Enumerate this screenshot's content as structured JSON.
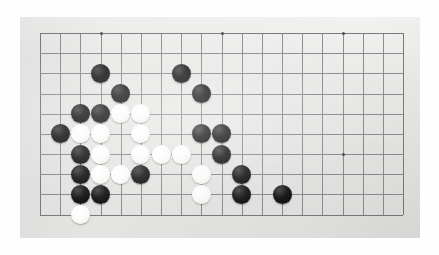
{
  "scene": {
    "kind": "go-board-photograph",
    "description": "Photograph of a Go (Weiqi / Baduk) board, cropped to the lower-left portion of the board"
  },
  "colors": {
    "page_background": "#fefefe",
    "board_surface": "#e8e8e6",
    "grid_line": "#8d8d8d",
    "board_edge_line": "#7a7a7a",
    "star_point": "#4e4e4e",
    "black_stone": "#141414",
    "white_stone": "#fbfbfa"
  },
  "board": {
    "surface_rect": {
      "x": 20,
      "y": 17,
      "width": 400,
      "height": 221
    },
    "origin": {
      "x": 40,
      "y": 33
    },
    "pitch": 20.17,
    "columns": 19,
    "rows": 10,
    "stone_diameter": 19,
    "star_points": [
      {
        "col": 3,
        "row": 0
      },
      {
        "col": 9,
        "row": 0
      },
      {
        "col": 15,
        "row": 0
      },
      {
        "col": 3,
        "row": 6
      },
      {
        "col": 9,
        "row": 6
      },
      {
        "col": 15,
        "row": 6
      }
    ],
    "stones": [
      {
        "col": 3,
        "row": 2,
        "color": "black"
      },
      {
        "col": 7,
        "row": 2,
        "color": "black"
      },
      {
        "col": 4,
        "row": 3,
        "color": "black"
      },
      {
        "col": 8,
        "row": 3,
        "color": "black"
      },
      {
        "col": 2,
        "row": 4,
        "color": "black"
      },
      {
        "col": 3,
        "row": 4,
        "color": "black"
      },
      {
        "col": 4,
        "row": 4,
        "color": "white"
      },
      {
        "col": 5,
        "row": 4,
        "color": "white"
      },
      {
        "col": 1,
        "row": 5,
        "color": "black"
      },
      {
        "col": 2,
        "row": 5,
        "color": "white"
      },
      {
        "col": 3,
        "row": 5,
        "color": "white"
      },
      {
        "col": 5,
        "row": 5,
        "color": "white"
      },
      {
        "col": 8,
        "row": 5,
        "color": "black"
      },
      {
        "col": 9,
        "row": 5,
        "color": "black"
      },
      {
        "col": 2,
        "row": 6,
        "color": "black"
      },
      {
        "col": 3,
        "row": 6,
        "color": "white"
      },
      {
        "col": 5,
        "row": 6,
        "color": "white"
      },
      {
        "col": 6,
        "row": 6,
        "color": "white"
      },
      {
        "col": 7,
        "row": 6,
        "color": "white"
      },
      {
        "col": 9,
        "row": 6,
        "color": "black"
      },
      {
        "col": 2,
        "row": 7,
        "color": "black"
      },
      {
        "col": 3,
        "row": 7,
        "color": "white"
      },
      {
        "col": 4,
        "row": 7,
        "color": "white"
      },
      {
        "col": 5,
        "row": 7,
        "color": "black"
      },
      {
        "col": 8,
        "row": 7,
        "color": "white"
      },
      {
        "col": 10,
        "row": 7,
        "color": "black"
      },
      {
        "col": 2,
        "row": 8,
        "color": "black"
      },
      {
        "col": 3,
        "row": 8,
        "color": "black"
      },
      {
        "col": 8,
        "row": 8,
        "color": "white"
      },
      {
        "col": 10,
        "row": 8,
        "color": "black"
      },
      {
        "col": 12,
        "row": 8,
        "color": "black"
      },
      {
        "col": 2,
        "row": 9,
        "color": "white"
      }
    ],
    "stone_counts": {
      "black": 18,
      "white": 14,
      "total": 32
    }
  }
}
